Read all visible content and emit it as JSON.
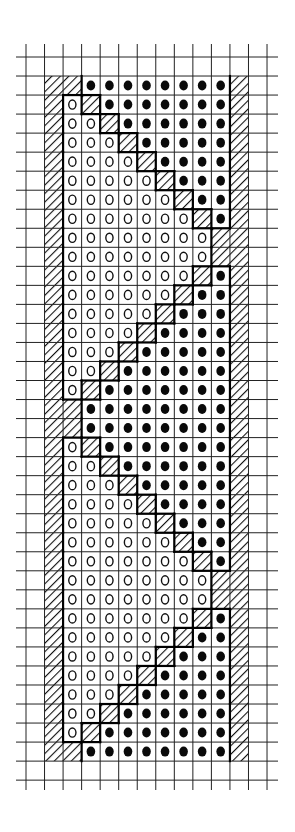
{
  "title": "Hand-drawn chart grid pattern",
  "symbols": {
    ".": "empty",
    "H": "diagonal-hatch",
    "O": "open-circle",
    "D": "filled-dot"
  },
  "grid": {
    "columns": 13,
    "rows": 38,
    "pattern_row_offset": 1,
    "col_x0": 26,
    "col_w": 18.54,
    "row_y0": 57,
    "row_h": 19.03,
    "hline_x_start": 16,
    "hline_x_end": 278,
    "vline_y_start": 44,
    "vline_y_end": 790,
    "line_color": "#222222",
    "thick_color": "#000000"
  },
  "pattern": [
    ".HHDDDDDDDDH.",
    ".HOHDDDDDDDH.",
    ".HOOHDDDDDDH.",
    ".HOOOHDDDDDH.",
    ".HOOOOHDDDDH.",
    ".HOOOOOHDDDH.",
    ".HOOOOOOHDDH.",
    ".HOOOOOOOHDH.",
    ".HOOOOOOOOHH.",
    ".HOOOOOOOOHH.",
    ".HOOOOOOOHDH.",
    ".HOOOOOOHDDH.",
    ".HOOOOOHDDDH.",
    ".HOOOOHDDDDH.",
    ".HOOOHDDDDDH.",
    ".HOOHDDDDDDH.",
    ".HOHDDDDDDDH.",
    ".HHDDDDDDDDH.",
    ".HHDDDDDDDDH.",
    ".HOHDDDDDDDH.",
    ".HOOHDDDDDDH.",
    ".HOOOHDDDDDH.",
    ".HOOOOHDDDDH.",
    ".HOOOOOHDDDH.",
    ".HOOOOOOHDDH.",
    ".HOOOOOOOHDH.",
    ".HOOOOOOOOHH.",
    ".HOOOOOOOOHH.",
    ".HOOOOOOOHDH.",
    ".HOOOOOOHDDH.",
    ".HOOOOOHDDDH.",
    ".HOOOOHDDDDH.",
    ".HOOOHDDDDDH.",
    ".HOOHDDDDDDH.",
    ".HOHDDDDDDDH.",
    ".HHDDDDDDDDH."
  ]
}
